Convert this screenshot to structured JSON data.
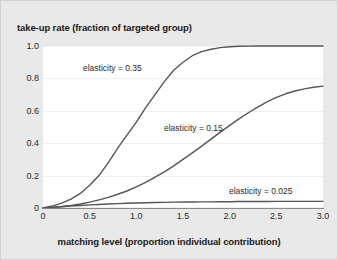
{
  "chart_data": {
    "type": "line",
    "title": "",
    "xlabel": "matching level (proportion individual contribution)",
    "ylabel": "take-up rate (fraction of targeted group)",
    "xlim": [
      0,
      3.0
    ],
    "ylim": [
      0,
      1.0
    ],
    "grid": "horizontal",
    "legend_position": "inline-annotations",
    "xticks": [
      "0",
      "0.5",
      "1.0",
      "1.5",
      "2.0",
      "2.5",
      "3.0"
    ],
    "xtick_values": [
      0,
      0.5,
      1.0,
      1.5,
      2.0,
      2.5,
      3.0
    ],
    "yticks": [
      "0",
      "0.2",
      "0.4",
      "0.6",
      "0.8",
      "1.0"
    ],
    "ytick_values": [
      0,
      0.2,
      0.4,
      0.6,
      0.8,
      1.0
    ],
    "x": [
      0,
      0.1,
      0.2,
      0.3,
      0.4,
      0.5,
      0.6,
      0.7,
      0.8,
      0.9,
      1.0,
      1.1,
      1.2,
      1.3,
      1.4,
      1.5,
      1.6,
      1.7,
      1.8,
      1.9,
      2.0,
      2.1,
      2.2,
      2.3,
      2.4,
      2.5,
      2.6,
      2.7,
      2.8,
      2.9,
      3.0
    ],
    "series": [
      {
        "name": "elasticity = 0.35",
        "color": "#555555",
        "annotation": "elasticity = 0.35",
        "values": [
          0.0,
          0.012,
          0.03,
          0.055,
          0.09,
          0.14,
          0.2,
          0.28,
          0.37,
          0.45,
          0.53,
          0.62,
          0.7,
          0.78,
          0.85,
          0.9,
          0.94,
          0.965,
          0.98,
          0.99,
          0.995,
          0.998,
          0.999,
          1.0,
          1.0,
          1.0,
          1.0,
          1.0,
          1.0,
          1.0,
          1.0
        ]
      },
      {
        "name": "elasticity = 0.15",
        "color": "#555555",
        "annotation": "elasticity = 0.15",
        "values": [
          0.0,
          0.004,
          0.009,
          0.016,
          0.025,
          0.036,
          0.05,
          0.066,
          0.085,
          0.105,
          0.13,
          0.158,
          0.19,
          0.223,
          0.26,
          0.3,
          0.34,
          0.382,
          0.425,
          0.468,
          0.51,
          0.55,
          0.588,
          0.623,
          0.655,
          0.683,
          0.705,
          0.722,
          0.735,
          0.745,
          0.752
        ]
      },
      {
        "name": "elasticity = 0.025",
        "color": "#555555",
        "annotation": "elasticity = 0.025",
        "values": [
          0.0,
          0.004,
          0.008,
          0.012,
          0.015,
          0.019,
          0.022,
          0.025,
          0.027,
          0.029,
          0.031,
          0.032,
          0.034,
          0.035,
          0.036,
          0.037,
          0.037,
          0.038,
          0.038,
          0.039,
          0.039,
          0.04,
          0.04,
          0.04,
          0.04,
          0.041,
          0.041,
          0.041,
          0.041,
          0.041,
          0.041
        ]
      }
    ],
    "annotations": [
      {
        "text": "elasticity = 0.35",
        "x_px": 82,
        "y_px": 62
      },
      {
        "text": "elasticity = 0.15",
        "x_px": 163,
        "y_px": 122
      },
      {
        "text": "elasticity = 0.025",
        "x_px": 228,
        "y_px": 185
      }
    ]
  }
}
